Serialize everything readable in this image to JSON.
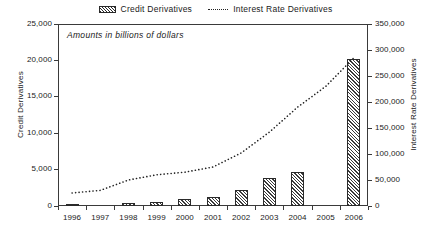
{
  "legend": {
    "entries": [
      {
        "label": "Credit Derivatives",
        "icon": "hatched-bar-swatch",
        "marker": "bar"
      },
      {
        "label": "Interest Rate Derivatives",
        "icon": "dotted-line-swatch",
        "marker": "dotted-line"
      }
    ]
  },
  "annotation": "Amounts in billions of dollars",
  "axes": {
    "left_title": "Credit Derivatives",
    "right_title": "Interest Rate Derivatives",
    "left_ticks": [
      "0",
      "5,000",
      "10,000",
      "15,000",
      "20,000",
      "25,000"
    ],
    "right_ticks": [
      "0",
      "50,000",
      "100,000",
      "150,000",
      "200,000",
      "250,000",
      "300,000",
      "350,000"
    ]
  },
  "colors": {
    "axis": "#3a3a3a",
    "bar_outline": "#2a2a2a",
    "bar_hatch": "#3a3a3a",
    "line": "#222222",
    "background": "#ffffff"
  },
  "chart_data": {
    "type": "bar",
    "title": "",
    "subtitle": "Amounts in billions of dollars",
    "xlabel": "",
    "ylabel": "Credit Derivatives",
    "y2label": "Interest Rate Derivatives",
    "categories": [
      "1996",
      "1997",
      "1998",
      "1999",
      "2000",
      "2001",
      "2002",
      "2003",
      "2004",
      "2005",
      "2006"
    ],
    "ylim": [
      0,
      25000
    ],
    "y2lim": [
      0,
      350000
    ],
    "grid": false,
    "legend_position": "top-center",
    "series": [
      {
        "name": "Credit Derivatives",
        "type": "bar",
        "axis": "left",
        "units": "billions of dollars",
        "values": [
          180,
          0,
          350,
          600,
          900,
          1200,
          2200,
          3800,
          4700,
          0,
          20200
        ]
      },
      {
        "name": "Interest Rate Derivatives",
        "type": "line",
        "style": "dotted",
        "axis": "right",
        "units": "billions of dollars",
        "values": [
          25000,
          30000,
          50000,
          60000,
          65000,
          75000,
          102000,
          142000,
          190000,
          230000,
          285000
        ]
      }
    ]
  }
}
